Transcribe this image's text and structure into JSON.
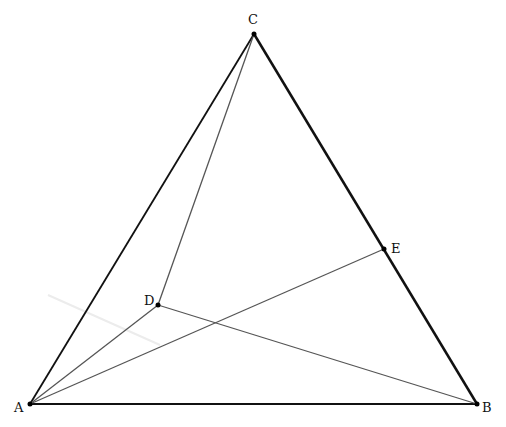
{
  "diagram": {
    "points": {
      "A": {
        "label": "A",
        "x": 30,
        "y": 404
      },
      "B": {
        "label": "B",
        "x": 477,
        "y": 404
      },
      "C": {
        "label": "C",
        "x": 254,
        "y": 34
      },
      "D": {
        "label": "D",
        "x": 158,
        "y": 305
      },
      "E": {
        "label": "E",
        "x": 384,
        "y": 249
      }
    },
    "triangle_edges": [
      "AB",
      "BC",
      "CA"
    ],
    "inner_segments": [
      "AD",
      "DC",
      "DB",
      "AE"
    ],
    "colors": {
      "edge": "#111111",
      "inner": "#555555",
      "point": "#000000"
    }
  }
}
